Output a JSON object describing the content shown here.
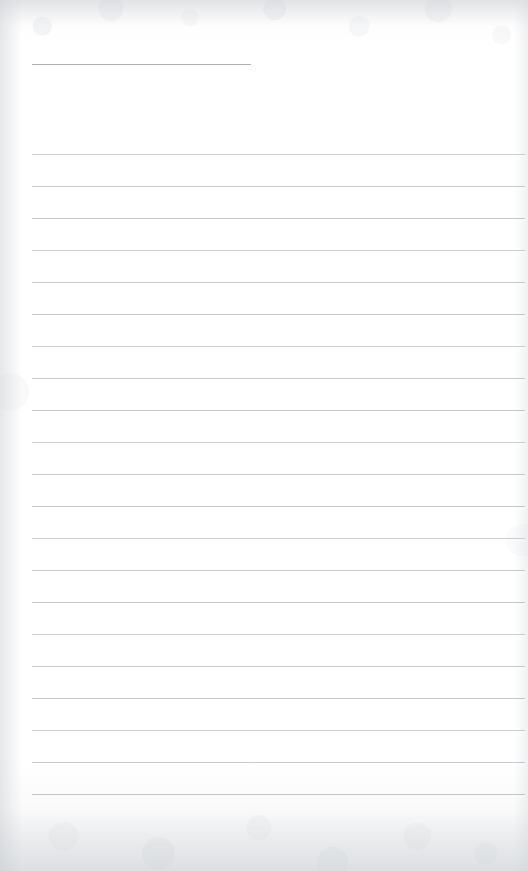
{
  "document": {
    "type": "scanned-ruled-paper",
    "title": "",
    "page_width": 528,
    "page_height": 871,
    "background_color": "#fdfdfd",
    "content_text": "",
    "is_blank": "true"
  },
  "header_rule": {
    "name": "title-rule",
    "x": 32,
    "y": 64,
    "width": 219,
    "color": "#a9adb2",
    "thickness": 1.4
  },
  "ruled_lines": {
    "color": "#bfc3c7",
    "thickness": 1,
    "left": 32,
    "right": 525,
    "width": 493,
    "spacing": 32,
    "first_y": 154,
    "count": 21,
    "y_positions": [
      154,
      186,
      218,
      250,
      282,
      314,
      346,
      378,
      410,
      442,
      474,
      506,
      538,
      570,
      602,
      634,
      666,
      698,
      730,
      762,
      794
    ]
  },
  "margins": {
    "left": 32,
    "right": 3,
    "top": 64,
    "bottom": 55
  },
  "texture": {
    "edge_shade_color": "#cdd1d5",
    "grain_opacity": "0.55"
  }
}
